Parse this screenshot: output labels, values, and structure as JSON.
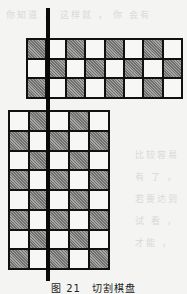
{
  "background_text": {
    "line1": "你知道 ， 这样就 ， 你 会有",
    "side_lines": [
      "比较容易",
      "有 了 ，",
      "若要达到",
      "试 看 ，",
      "才能 ，"
    ]
  },
  "figure": {
    "caption": "图 21　切割棋盘",
    "colors": {
      "line": "#111111",
      "dark_square": "#8a8a88",
      "light_square": "#f7f7f5",
      "cut_bar": "#0a0a0a"
    },
    "top_board": {
      "columns": 8,
      "rows": 3,
      "pattern": [
        [
          1,
          0,
          1,
          0,
          1,
          0,
          1,
          0
        ],
        [
          0,
          1,
          0,
          1,
          0,
          1,
          0,
          1
        ],
        [
          1,
          0,
          1,
          0,
          1,
          0,
          1,
          0
        ]
      ]
    },
    "bottom_board": {
      "columns": 5,
      "rows": 8,
      "pattern": [
        [
          0,
          1,
          0,
          1,
          0
        ],
        [
          1,
          0,
          1,
          0,
          1
        ],
        [
          0,
          1,
          0,
          1,
          0
        ],
        [
          1,
          0,
          1,
          0,
          1
        ],
        [
          0,
          1,
          0,
          1,
          0
        ],
        [
          1,
          0,
          1,
          0,
          1
        ],
        [
          0,
          1,
          0,
          1,
          0
        ],
        [
          1,
          0,
          1,
          0,
          1
        ]
      ]
    }
  }
}
